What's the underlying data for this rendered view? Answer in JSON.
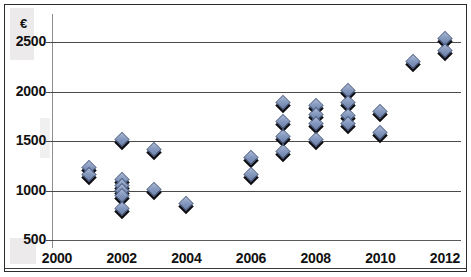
{
  "chart_data": {
    "type": "scatter",
    "title": "",
    "subtitle": "",
    "xlabel": "",
    "ylabel": "",
    "unit_label": "€",
    "xlim": [
      2000,
      2012.6
    ],
    "ylim": [
      500,
      2600
    ],
    "x_ticks": [
      2000,
      2002,
      2004,
      2006,
      2008,
      2010,
      2012
    ],
    "x_tick_labels": [
      "2000",
      "2002",
      "2004",
      "2006",
      "2008",
      "2010",
      "2012"
    ],
    "y_ticks": [
      500,
      1000,
      1500,
      2000,
      2500
    ],
    "y_tick_labels": [
      "500",
      "1000",
      "1500",
      "2000",
      "2500"
    ],
    "grid": "horizontal",
    "legend": "none",
    "marker": "diamond",
    "marker_color": "#8497bd",
    "marker_edge_color": "#56678c",
    "marker_shadow_color": "#0d0d12",
    "points": [
      {
        "x": 2001,
        "y": 1215
      },
      {
        "x": 2001,
        "y": 1150
      },
      {
        "x": 2002,
        "y": 1500
      },
      {
        "x": 2002,
        "y": 1100
      },
      {
        "x": 2002,
        "y": 1040
      },
      {
        "x": 2002,
        "y": 980
      },
      {
        "x": 2002,
        "y": 930
      },
      {
        "x": 2002,
        "y": 800
      },
      {
        "x": 2003,
        "y": 1400
      },
      {
        "x": 2003,
        "y": 1000
      },
      {
        "x": 2004,
        "y": 850
      },
      {
        "x": 2006,
        "y": 1320
      },
      {
        "x": 2006,
        "y": 1150
      },
      {
        "x": 2007,
        "y": 1870
      },
      {
        "x": 2007,
        "y": 1680
      },
      {
        "x": 2007,
        "y": 1530
      },
      {
        "x": 2007,
        "y": 1380
      },
      {
        "x": 2008,
        "y": 1840
      },
      {
        "x": 2008,
        "y": 1750
      },
      {
        "x": 2008,
        "y": 1660
      },
      {
        "x": 2008,
        "y": 1500
      },
      {
        "x": 2009,
        "y": 1990
      },
      {
        "x": 2009,
        "y": 1870
      },
      {
        "x": 2009,
        "y": 1740
      },
      {
        "x": 2009,
        "y": 1660
      },
      {
        "x": 2010,
        "y": 1780
      },
      {
        "x": 2010,
        "y": 1570
      },
      {
        "x": 2011,
        "y": 2290
      },
      {
        "x": 2012,
        "y": 2520
      },
      {
        "x": 2012,
        "y": 2400
      }
    ]
  }
}
